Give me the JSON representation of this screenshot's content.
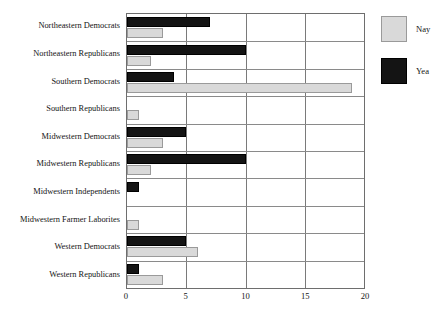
{
  "chart_data": {
    "type": "bar",
    "orientation": "horizontal",
    "title": "",
    "xlabel": "",
    "ylabel": "",
    "xlim": [
      0,
      20
    ],
    "xticks": [
      0,
      5,
      10,
      15,
      20
    ],
    "grid": true,
    "legend_position": "right",
    "categories": [
      "Northeastern Democrats",
      "Northeastern Republicans",
      "Southern Democrats",
      "Southern Republicans",
      "Midwestern Democrats",
      "Midwestern Republicans",
      "Midwestern Independents",
      "Midwestern Farmer Laborites",
      "Western Democrats",
      "Western Republicans"
    ],
    "series": [
      {
        "name": "Yea",
        "color": "#141414",
        "values": [
          7,
          10,
          4,
          0,
          5,
          10,
          1,
          0,
          5,
          1
        ]
      },
      {
        "name": "Nay",
        "color": "#d9d9d9",
        "values": [
          3,
          2,
          19,
          1,
          3,
          2,
          0,
          1,
          6,
          3
        ]
      }
    ]
  },
  "legend": {
    "items": [
      {
        "label": "Nay",
        "color": "#d9d9d9"
      },
      {
        "label": "Yea",
        "color": "#141414"
      }
    ]
  }
}
